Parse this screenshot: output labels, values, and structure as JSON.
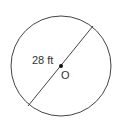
{
  "diagram": {
    "shape": "circle",
    "diameter_label": "28 ft",
    "center_label": "O",
    "stroke_color": "#444444",
    "text_color": "#333333"
  }
}
